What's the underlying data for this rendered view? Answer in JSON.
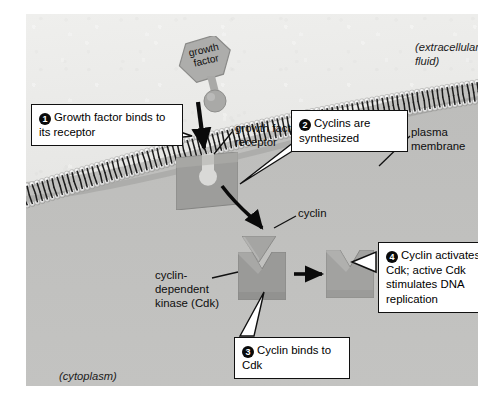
{
  "figure": {
    "background_color": "#e9e9e7"
  },
  "regions": {
    "extracellular": "(extracellular\nfluid)",
    "cytoplasm": "(cytoplasm)"
  },
  "callouts": [
    {
      "number": "1",
      "glyph": "❶",
      "text": "Growth factor binds to its receptor"
    },
    {
      "number": "2",
      "glyph": "❷",
      "text": "Cyclins are synthesized"
    },
    {
      "number": "3",
      "glyph": "❸",
      "text": "Cyclin binds to Cdk"
    },
    {
      "number": "4",
      "glyph": "❹",
      "text": "Cyclin activates Cdk; active Cdk stimulates DNA replication"
    }
  ],
  "labels": {
    "growth_factor": "growth\nfactor",
    "growth_factor_receptor": "growth factor\nreceptor",
    "plasma_membrane": "plasma\nmembrane",
    "cyclin": "cyclin",
    "cdk": "cyclin-\ndependent\nkinase (Cdk)"
  },
  "molecules": {
    "growth_factor": {
      "shape": "hexagon-with-stem",
      "color": "#a7a7a5"
    },
    "receptor": {
      "shape": "square-with-keyhole-notch",
      "color": "#9c9c9a"
    },
    "cyclin": {
      "shape": "chevron-wedge",
      "color": "#a3a3a1"
    },
    "cdk": {
      "shape": "square-with-v-notch",
      "color": "#9a9a98"
    },
    "cdk_cyclin_complex": {
      "shape": "square-with-v-notch-filled",
      "color": "#a0a09e"
    }
  },
  "membrane": {
    "name": "phospholipid-bilayer",
    "head_color": "#d8d8d6",
    "tail_color": "#1b1b1b"
  }
}
